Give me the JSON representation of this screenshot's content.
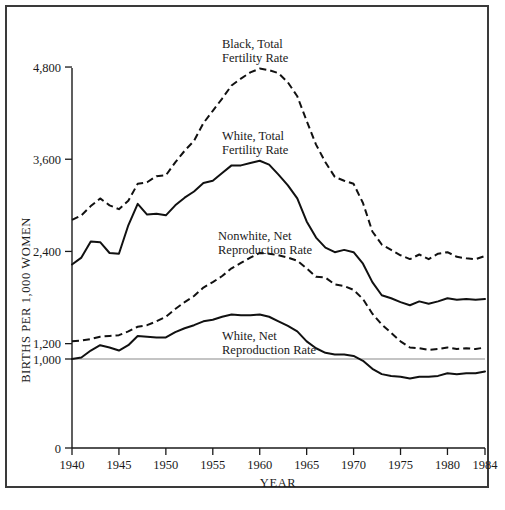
{
  "figure": {
    "ylabel": "BIRTHS PER 1,000 WOMEN",
    "xlabel": "YEAR"
  },
  "annotations": {
    "black_tfr_line1": "Black, Total",
    "black_tfr_line2": "Fertility Rate",
    "white_tfr_line1": "White, Total",
    "white_tfr_line2": "Fertility Rate",
    "nonwhite_nrr_line1": "Nonwhite, Net",
    "nonwhite_nrr_line2": "Reproduction Rate",
    "white_nrr_line1": "White, Net",
    "white_nrr_line2": "Reproduction Rate"
  },
  "axis": {
    "y_ticks": [
      "4,800",
      "3,600",
      "2,400",
      "1,200",
      "1,000",
      "0"
    ],
    "x_ticks": [
      "1940",
      "1945",
      "1950",
      "1955",
      "1960",
      "1965",
      "1970",
      "1975",
      "1980",
      "1984"
    ]
  },
  "chart_data": {
    "type": "line",
    "title": "",
    "xlabel": "YEAR",
    "ylabel": "BIRTHS PER 1,000 WOMEN",
    "xlim": [
      1940,
      1984
    ],
    "ylim": [
      0,
      4800
    ],
    "y_ticks": [
      0,
      1000,
      1200,
      2400,
      3600,
      4800
    ],
    "x_ticks": [
      1940,
      1945,
      1950,
      1955,
      1960,
      1965,
      1970,
      1975,
      1980,
      1984
    ],
    "grid": false,
    "legend": "inline annotations",
    "reference_lines": [
      {
        "y": 1000,
        "label": "1,000",
        "color": "#8a8a8a"
      }
    ],
    "x": [
      1940,
      1941,
      1942,
      1943,
      1944,
      1945,
      1946,
      1947,
      1948,
      1949,
      1950,
      1951,
      1952,
      1953,
      1954,
      1955,
      1956,
      1957,
      1958,
      1959,
      1960,
      1961,
      1962,
      1963,
      1964,
      1965,
      1966,
      1967,
      1968,
      1969,
      1970,
      1971,
      1972,
      1973,
      1974,
      1975,
      1976,
      1977,
      1978,
      1979,
      1980,
      1981,
      1982,
      1983,
      1984
    ],
    "series": [
      {
        "name": "Black, Total Fertility Rate",
        "style": "dashed",
        "color": "#111111",
        "values": [
          2810,
          2870,
          2990,
          3090,
          3000,
          2950,
          3060,
          3280,
          3300,
          3380,
          3390,
          3560,
          3710,
          3840,
          4070,
          4230,
          4390,
          4560,
          4650,
          4730,
          4780,
          4760,
          4720,
          4600,
          4420,
          4100,
          3790,
          3560,
          3370,
          3320,
          3280,
          3030,
          2660,
          2490,
          2420,
          2350,
          2300,
          2360,
          2300,
          2370,
          2390,
          2330,
          2310,
          2300,
          2340
        ]
      },
      {
        "name": "White, Total Fertility Rate",
        "style": "solid",
        "color": "#111111",
        "values": [
          2230,
          2320,
          2530,
          2520,
          2380,
          2370,
          2740,
          3020,
          2880,
          2890,
          2870,
          3000,
          3100,
          3180,
          3290,
          3320,
          3420,
          3520,
          3520,
          3550,
          3580,
          3530,
          3400,
          3260,
          3090,
          2790,
          2580,
          2450,
          2390,
          2420,
          2390,
          2240,
          2000,
          1830,
          1790,
          1740,
          1700,
          1750,
          1720,
          1750,
          1790,
          1770,
          1780,
          1770,
          1780
        ]
      },
      {
        "name": "Nonwhite, Net Reproduction Rate",
        "style": "dashed",
        "color": "#111111",
        "values": [
          1230,
          1240,
          1260,
          1290,
          1300,
          1310,
          1360,
          1420,
          1440,
          1490,
          1550,
          1650,
          1740,
          1820,
          1930,
          2000,
          2080,
          2180,
          2250,
          2320,
          2380,
          2370,
          2350,
          2320,
          2280,
          2180,
          2070,
          2060,
          1970,
          1950,
          1900,
          1780,
          1590,
          1450,
          1340,
          1230,
          1150,
          1140,
          1120,
          1130,
          1150,
          1130,
          1140,
          1130,
          1150
        ]
      },
      {
        "name": "White, Net Reproduction Rate",
        "style": "solid",
        "color": "#111111",
        "values": [
          1000,
          1020,
          1110,
          1180,
          1150,
          1110,
          1180,
          1300,
          1290,
          1280,
          1280,
          1350,
          1400,
          1440,
          1490,
          1510,
          1550,
          1580,
          1570,
          1570,
          1580,
          1550,
          1490,
          1430,
          1360,
          1230,
          1140,
          1080,
          1060,
          1060,
          1040,
          980,
          890,
          830,
          810,
          800,
          780,
          800,
          800,
          810,
          840,
          830,
          840,
          840,
          860
        ]
      }
    ]
  }
}
